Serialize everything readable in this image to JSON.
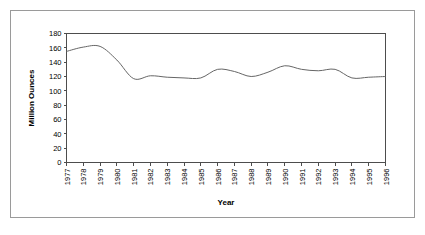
{
  "figure": {
    "background_color": "#ffffff",
    "frame_color": "#9a9a9a",
    "line_color": "#666666",
    "axis_color": "#4d4d4d"
  },
  "chart_data": {
    "type": "line",
    "title": "",
    "xlabel": "Year",
    "ylabel": "Million Ounces",
    "xlim": [
      1977,
      1996
    ],
    "ylim": [
      0,
      180
    ],
    "ytick_step": 20,
    "grid": false,
    "legend": "none",
    "categories": [
      "1977",
      "1978",
      "1979",
      "1980",
      "1981",
      "1982",
      "1983",
      "1984",
      "1985",
      "1986",
      "1987",
      "1988",
      "1989",
      "1990",
      "1991",
      "1992",
      "1993",
      "1994",
      "1995",
      "1996"
    ],
    "x": [
      1977,
      1978,
      1979,
      1980,
      1981,
      1982,
      1983,
      1984,
      1985,
      1986,
      1987,
      1988,
      1989,
      1990,
      1991,
      1992,
      1993,
      1994,
      1995,
      1996
    ],
    "values": [
      155,
      161,
      162,
      143,
      117,
      121,
      119,
      118,
      118,
      130,
      127,
      120,
      126,
      135,
      130,
      128,
      130,
      118,
      119,
      120
    ],
    "ytick_labels": [
      "0",
      "20",
      "40",
      "60",
      "80",
      "100",
      "120",
      "140",
      "160",
      "180"
    ],
    "ytick_values": [
      0,
      20,
      40,
      60,
      80,
      100,
      120,
      140,
      160,
      180
    ]
  }
}
